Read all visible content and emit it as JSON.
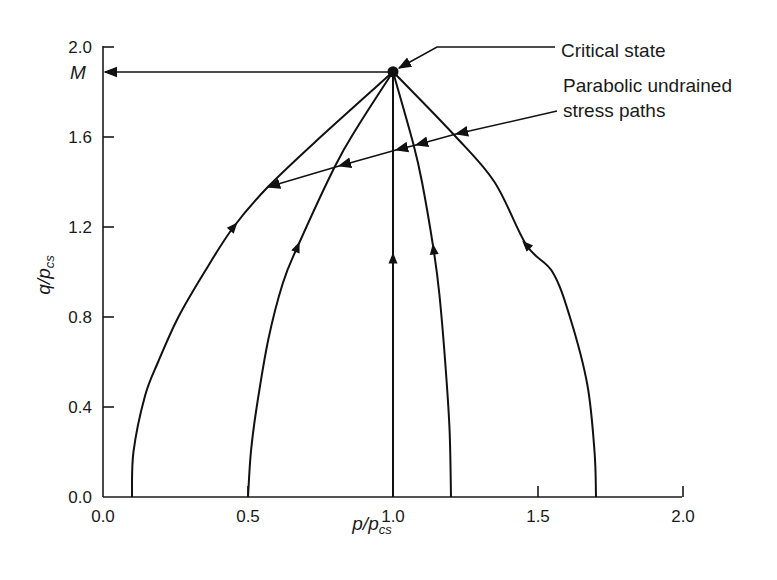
{
  "chart_data": {
    "type": "line",
    "title": "",
    "xlabel": "p/p_cs",
    "ylabel": "q/p_cs",
    "xlim": [
      0.0,
      2.0
    ],
    "ylim": [
      0.0,
      2.0
    ],
    "grid": false,
    "x_ticks": [
      "0.0",
      "0.5",
      "1.0",
      "1.5",
      "2.0"
    ],
    "y_ticks": [
      "0.0",
      "0.4",
      "0.8",
      "1.2",
      "1.6",
      "2.0"
    ],
    "critical_state": {
      "p": 1.0,
      "q": 1.89,
      "label": "M"
    },
    "series": [
      {
        "name": "Undrained path p0=0.1",
        "points": [
          [
            0.1,
            0
          ],
          [
            0.105,
            0.2
          ],
          [
            0.145,
            0.45
          ],
          [
            0.19,
            0.6
          ],
          [
            0.26,
            0.8
          ],
          [
            0.35,
            1.0
          ],
          [
            0.45,
            1.2
          ],
          [
            0.57,
            1.38
          ],
          [
            0.75,
            1.6
          ],
          [
            1.0,
            1.89
          ]
        ],
        "arrow_at": [
          0.45,
          1.2
        ]
      },
      {
        "name": "Undrained path p0=0.5",
        "points": [
          [
            0.5,
            0
          ],
          [
            0.51,
            0.2
          ],
          [
            0.53,
            0.4
          ],
          [
            0.57,
            0.7
          ],
          [
            0.62,
            0.95
          ],
          [
            0.67,
            1.11
          ],
          [
            0.8,
            1.47
          ],
          [
            0.88,
            1.65
          ],
          [
            1.0,
            1.89
          ]
        ],
        "arrow_at": [
          0.67,
          1.11
        ]
      },
      {
        "name": "Undrained path p0=1.0",
        "points": [
          [
            1.0,
            0
          ],
          [
            1.0,
            1.89
          ]
        ],
        "arrow_at": [
          1.0,
          1.06
        ]
      },
      {
        "name": "Undrained path p0=1.2",
        "points": [
          [
            1.2,
            0
          ],
          [
            1.195,
            0.3
          ],
          [
            1.18,
            0.6
          ],
          [
            1.16,
            0.9
          ],
          [
            1.14,
            1.1
          ],
          [
            1.1,
            1.4
          ],
          [
            1.07,
            1.57
          ],
          [
            1.0,
            1.89
          ]
        ],
        "arrow_at": [
          1.14,
          1.1
        ]
      },
      {
        "name": "Undrained path p0=1.7",
        "points": [
          [
            1.7,
            0
          ],
          [
            1.695,
            0.2
          ],
          [
            1.67,
            0.5
          ],
          [
            1.61,
            0.8
          ],
          [
            1.55,
            1.0
          ],
          [
            1.46,
            1.12
          ],
          [
            1.35,
            1.4
          ],
          [
            1.21,
            1.61
          ],
          [
            1.0,
            1.89
          ]
        ],
        "arrow_at": [
          1.46,
          1.12
        ]
      }
    ],
    "annotations": [
      {
        "text": "Critical state",
        "points_to": [
          1.0,
          1.89
        ]
      },
      {
        "text": "Parabolic undrained stress paths",
        "points_to": [
          [
            0.57,
            1.38
          ],
          [
            0.81,
            1.47
          ],
          [
            1.0,
            1.54
          ],
          [
            1.07,
            1.56
          ],
          [
            1.21,
            1.61
          ]
        ]
      }
    ]
  },
  "labels": {
    "y_axis_main": "q/p",
    "y_axis_sub": "cs",
    "x_axis_main": "p/p",
    "x_axis_sub": "cs",
    "m_label": "M",
    "critical_state": "Critical state",
    "parabolic_line1": "Parabolic undrained",
    "parabolic_line2": "stress paths"
  }
}
